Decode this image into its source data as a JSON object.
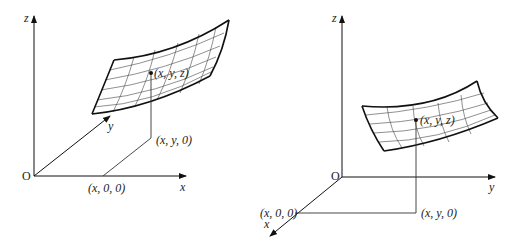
{
  "figures": [
    {
      "id": "left",
      "description": "Surface z = f(x,y) with x-axis horizontal and y-axis oblique",
      "labels": {
        "z_axis": "z",
        "x_axis": "x",
        "y_axis": "y",
        "origin": "O",
        "point_surface": "(x, y, z)",
        "point_xy": "(x, y, 0)",
        "point_x": "(x, 0, 0)"
      }
    },
    {
      "id": "right",
      "description": "Surface z = f(x,y) with y-axis horizontal and x-axis oblique",
      "labels": {
        "z_axis": "z",
        "x_axis": "x",
        "y_axis": "y",
        "origin": "O",
        "point_surface": "(x, y, z)",
        "point_xy": "(x, y, 0)",
        "point_x": "(x, 0, 0)"
      }
    }
  ],
  "colors": {
    "line": "#111111",
    "background": "#ffffff"
  }
}
